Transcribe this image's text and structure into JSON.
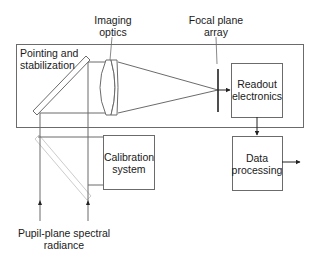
{
  "diagram": {
    "title_labels": {
      "imaging_optics": [
        "Imaging",
        "optics"
      ],
      "focal_plane_array": [
        "Focal plane",
        "array"
      ]
    },
    "main_box": {
      "label": [
        "Pointing and",
        "stabilization"
      ]
    },
    "blocks": {
      "readout": [
        "Readout",
        "electronics"
      ],
      "calibration": [
        "Calibration",
        "system"
      ],
      "data_processing": [
        "Data",
        "processing"
      ]
    },
    "input_label": [
      "Pupil-plane spectral",
      "radiance"
    ],
    "colors": {
      "line": "#6b6b6b",
      "dark_line": "#222222",
      "ghost_mirror": "#c8c8c8",
      "text": "#1a1a1a"
    }
  }
}
